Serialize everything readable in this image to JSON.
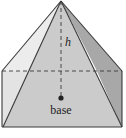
{
  "diagram": {
    "labels": {
      "height": "h",
      "base": "base"
    },
    "colors": {
      "edge": "#3a3a3a",
      "left_face": "#e6e6e6",
      "front_face": "#c9c9c9",
      "right_face": "#a9a9a9",
      "box_side": "#dcdcdc",
      "box_right": "#bdbdbd",
      "background": "#ffffff"
    }
  }
}
